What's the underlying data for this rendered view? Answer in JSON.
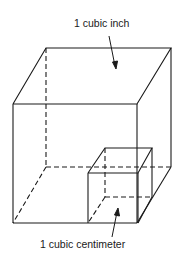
{
  "diagram": {
    "labels": {
      "large_cube": "1 cubic inch",
      "small_cube": "1 cubic centimeter"
    },
    "colors": {
      "line": "#1a1a1a",
      "background": "#ffffff"
    }
  }
}
